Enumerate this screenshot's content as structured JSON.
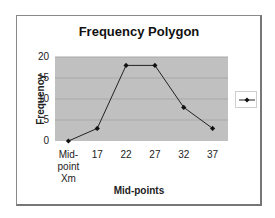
{
  "chart_data": {
    "type": "line",
    "title": "Frequency Polygon",
    "xlabel": "Mid-points",
    "ylabel": "Frequency",
    "categories": [
      "Mid-point Xm",
      "17",
      "22",
      "27",
      "32",
      "37"
    ],
    "series": [
      {
        "name": "",
        "values": [
          0,
          3,
          18,
          18,
          8,
          3
        ],
        "color": "#222222",
        "marker": "diamond"
      }
    ],
    "ylim": [
      0,
      20
    ],
    "yticks": [
      0,
      5,
      10,
      15,
      20
    ],
    "grid": true,
    "plot_background": "#c0c0c0",
    "legend_position": "right"
  },
  "labels": {
    "title": "Frequency Polygon",
    "xlabel": "Mid-points",
    "ylabel": "Frequency",
    "yticks": [
      "0",
      "5",
      "10",
      "15",
      "20"
    ],
    "xticks": [
      [
        "Mid-",
        "point",
        "Xm"
      ],
      [
        "17"
      ],
      [
        "22"
      ],
      [
        "27"
      ],
      [
        "32"
      ],
      [
        "37"
      ]
    ]
  }
}
